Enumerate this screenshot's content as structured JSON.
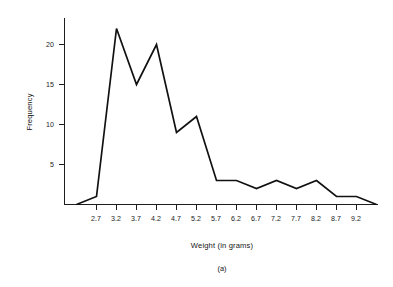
{
  "chart_data": {
    "type": "line",
    "title": "",
    "subtitle": "",
    "caption": "(a)",
    "xlabel": "Weight (in grams)",
    "ylabel": "Frequency",
    "grid": false,
    "legend": null,
    "xlim": [
      2.2,
      9.7
    ],
    "ylim": [
      0,
      23
    ],
    "xticks": [
      "2.7",
      "3.2",
      "3.7",
      "4.2",
      "4.7",
      "5.2",
      "5.7",
      "6.2",
      "6.7",
      "7.2",
      "7.7",
      "8.2",
      "8.7",
      "9.2"
    ],
    "yticks": [
      "5",
      "10",
      "15",
      "20"
    ],
    "ytick_values": [
      5,
      10,
      15,
      20
    ],
    "x": [
      2.2,
      2.7,
      3.2,
      3.7,
      4.2,
      4.7,
      5.2,
      5.7,
      6.2,
      6.7,
      7.2,
      7.7,
      8.2,
      8.7,
      9.2,
      9.7
    ],
    "values": [
      0,
      1,
      22,
      15,
      20,
      9,
      11,
      3,
      3,
      2,
      3,
      2,
      3,
      1,
      1,
      0
    ],
    "series": [
      {
        "name": "Frequency",
        "values": [
          0,
          1,
          22,
          15,
          20,
          9,
          11,
          3,
          3,
          2,
          3,
          2,
          3,
          1,
          1,
          0
        ]
      }
    ],
    "line_color": "#111111",
    "axis_color": "#1d1d1d",
    "background_color": "#ffffff"
  },
  "figure": {
    "ylabel": "Frequency",
    "xlabel": "Weight (in grams)",
    "caption": "(a)"
  }
}
